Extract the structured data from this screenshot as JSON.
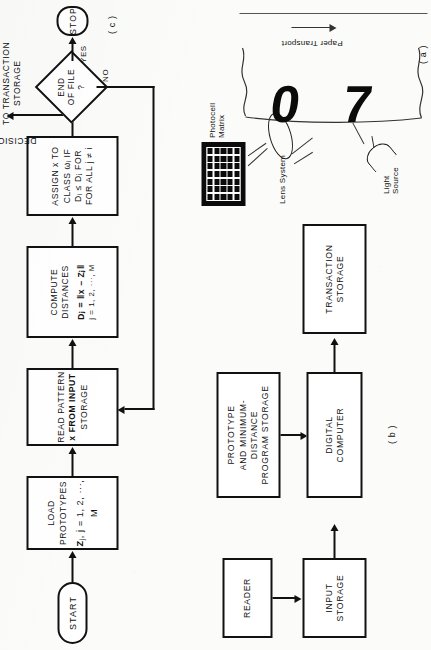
{
  "figure": {
    "orientation": "rotated-90-ccw",
    "ink_color": "#111111",
    "paper_color": "#fbfbfa"
  },
  "panel_a": {
    "caption": "( a )",
    "labels": {
      "photocell_matrix": [
        "Photocell",
        "Matrix"
      ],
      "lens_system": "Lens System",
      "light_source": [
        "Light",
        "Source"
      ],
      "paper_transport": "Paper  Transport"
    },
    "characters_on_paper": [
      "0",
      "7"
    ],
    "matrix": {
      "columns": 7,
      "rows": 5
    }
  },
  "panel_b": {
    "caption": "( b )",
    "blocks": [
      {
        "id": "reader",
        "lines": [
          "READER"
        ]
      },
      {
        "id": "input-storage",
        "lines": [
          "INPUT",
          "STORAGE"
        ]
      },
      {
        "id": "prototype-storage",
        "lines": [
          "PROTOTYPE",
          "AND MINIMUM-",
          "DISTANCE",
          "PROGRAM STORAGE"
        ]
      },
      {
        "id": "digital-computer",
        "lines": [
          "DIGITAL",
          "COMPUTER"
        ]
      },
      {
        "id": "transaction-storage",
        "lines": [
          "TRANSACTION",
          "STORAGE"
        ]
      }
    ]
  },
  "panel_c": {
    "caption": "( c )",
    "start_label": "START",
    "stop_label": "STOP",
    "steps": [
      {
        "id": "load-prototypes",
        "line1": "LOAD PROTOTYPES",
        "formula_main": "Z",
        "formula_sub": "j",
        "formula_rest": ", j = 1, 2, ···, M"
      },
      {
        "id": "read-pattern",
        "line1": "READ PATTERN",
        "line2": "x FROM INPUT",
        "line3": "STORAGE"
      },
      {
        "id": "compute-distances",
        "line1": "COMPUTE  DISTANCES",
        "line2": "Dⱼ = ‖x − Zⱼ‖",
        "line3": "j = 1, 2, ···, M"
      },
      {
        "id": "assign-class",
        "line1": "ASSIGN x TO",
        "line2": "CLASS ωᵢ IF",
        "line3": "Dᵢ ≤ Dⱼ FOR",
        "line4": "FOR ALL  j ≠ i"
      }
    ],
    "decision": {
      "id": "end-of-file",
      "lines": [
        "END",
        "OF FILE",
        "?"
      ],
      "branch_yes": "YES",
      "branch_no": "NO"
    },
    "annotations": {
      "decision_label": "DECISION",
      "to_transaction_storage": [
        "TO TRANSACTION",
        "STORAGE"
      ]
    }
  }
}
